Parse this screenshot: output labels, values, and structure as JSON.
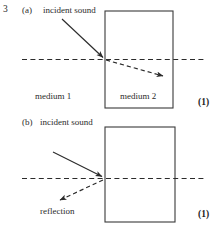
{
  "document": {
    "question_number": "3",
    "figure_type": "physics-ray-diagram"
  },
  "parts": [
    {
      "id": "a",
      "label": "(a)",
      "incident_label": "incident sound",
      "medium_left_label": "medium 1",
      "medium_right_label": "medium 2",
      "marks": "(1)"
    },
    {
      "id": "b",
      "label": "(b)",
      "incident_label": "incident sound",
      "reflection_label": "reflection",
      "marks": "(1)"
    }
  ],
  "colors": {
    "ink": "#2b2b2b",
    "rule": "#3a3a3a",
    "background": "#ffffff"
  },
  "diagram_a": {
    "boundary_box": {
      "x": 105,
      "y": 11,
      "w": 68,
      "h": 97
    },
    "normal_line": {
      "x1": 22,
      "y1": 59,
      "x2": 206,
      "y2": 59,
      "style": "dashed"
    },
    "incident_ray": {
      "x1": 62,
      "y1": 19,
      "x2": 104,
      "y2": 58,
      "style": "solid",
      "arrow": "end"
    },
    "refracted_ray": {
      "x1": 105,
      "y1": 59,
      "x2": 166,
      "y2": 77,
      "style": "dashed",
      "arrow": "end"
    }
  },
  "diagram_b": {
    "boundary_box": {
      "x": 105,
      "y": 127,
      "w": 70,
      "h": 95
    },
    "normal_line": {
      "x1": 22,
      "y1": 178,
      "x2": 206,
      "y2": 178,
      "style": "dashed"
    },
    "incident_ray": {
      "x1": 53,
      "y1": 152,
      "x2": 104,
      "y2": 177,
      "style": "solid",
      "arrow": "end"
    },
    "reflected_ray": {
      "x1": 104,
      "y1": 178,
      "x2": 57,
      "y2": 201,
      "style": "dashed",
      "arrow": "end"
    }
  }
}
